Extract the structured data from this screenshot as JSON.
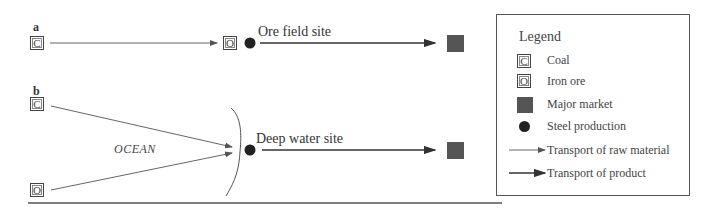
{
  "diagram": {
    "panel_a": {
      "label": "a",
      "source": {
        "symbol": "C",
        "meaning": "Coal"
      },
      "site_symbol": "O",
      "site_label": "Ore field site"
    },
    "panel_b": {
      "label": "b",
      "sources": [
        {
          "symbol": "C",
          "meaning": "Coal"
        },
        {
          "symbol": "O",
          "meaning": "Iron ore"
        }
      ],
      "region_label": "OCEAN",
      "site_label": "Deep water site"
    }
  },
  "legend": {
    "title": "Legend",
    "items": [
      {
        "symbol": "C",
        "label": "Coal"
      },
      {
        "symbol": "O",
        "label": "Iron ore"
      },
      {
        "symbol": "filled-square",
        "label": "Major market"
      },
      {
        "symbol": "filled-circle",
        "label": "Steel production"
      },
      {
        "symbol": "thin-arrow",
        "label": "Transport of raw material"
      },
      {
        "symbol": "thick-arrow",
        "label": "Transport of product"
      }
    ]
  },
  "colors": {
    "market": "#555555",
    "steel": "#222222",
    "lines": "#555555"
  }
}
